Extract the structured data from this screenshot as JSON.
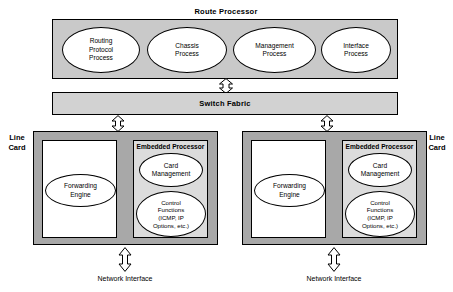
{
  "diagram": {
    "route_processor": {
      "label": "Route Processor",
      "processes": [
        {
          "name": "routing-protocol-process",
          "lines": [
            "Routing",
            "Protocol",
            "Process"
          ]
        },
        {
          "name": "chassis-process",
          "lines": [
            "Chassis",
            "Process"
          ]
        },
        {
          "name": "management-process",
          "lines": [
            "Management",
            "Process"
          ]
        },
        {
          "name": "interface-process",
          "lines": [
            "Interface",
            "Process"
          ]
        }
      ]
    },
    "switch_fabric": {
      "label": "Switch Fabric"
    },
    "line_cards": [
      {
        "side_label": "Line\nCard",
        "side_label_line1": "Line",
        "side_label_line2": "Card",
        "forwarding_engine": {
          "lines": [
            "Forwarding",
            "Engine"
          ]
        },
        "embedded_processor": {
          "label": "Embedded Processor",
          "card_management": {
            "lines": [
              "Card",
              "Management"
            ]
          },
          "control_functions": {
            "lines": [
              "Control",
              "Functions",
              "(ICMP, IP",
              "Options, etc.)"
            ]
          }
        },
        "network_interface_label": "Network Interface"
      },
      {
        "side_label": "Line\nCard",
        "side_label_line1": "Line",
        "side_label_line2": "Card",
        "forwarding_engine": {
          "lines": [
            "Forwarding",
            "Engine"
          ]
        },
        "embedded_processor": {
          "label": "Embedded Processor",
          "card_management": {
            "lines": [
              "Card",
              "Management"
            ]
          },
          "control_functions": {
            "lines": [
              "Control",
              "Functions",
              "(ICMP, IP",
              "Options, etc.)"
            ]
          }
        },
        "network_interface_label": "Network Interface"
      }
    ],
    "colors": {
      "route_processor_fill": "#c9c9c9",
      "switch_fabric_fill": "#d2d2d2",
      "line_card_fill": "#a8a8a8",
      "embedded_processor_fill": "#dcdcdc",
      "ellipse_fill": "#ffffff",
      "stroke": "#000000",
      "background": "#ffffff"
    }
  }
}
